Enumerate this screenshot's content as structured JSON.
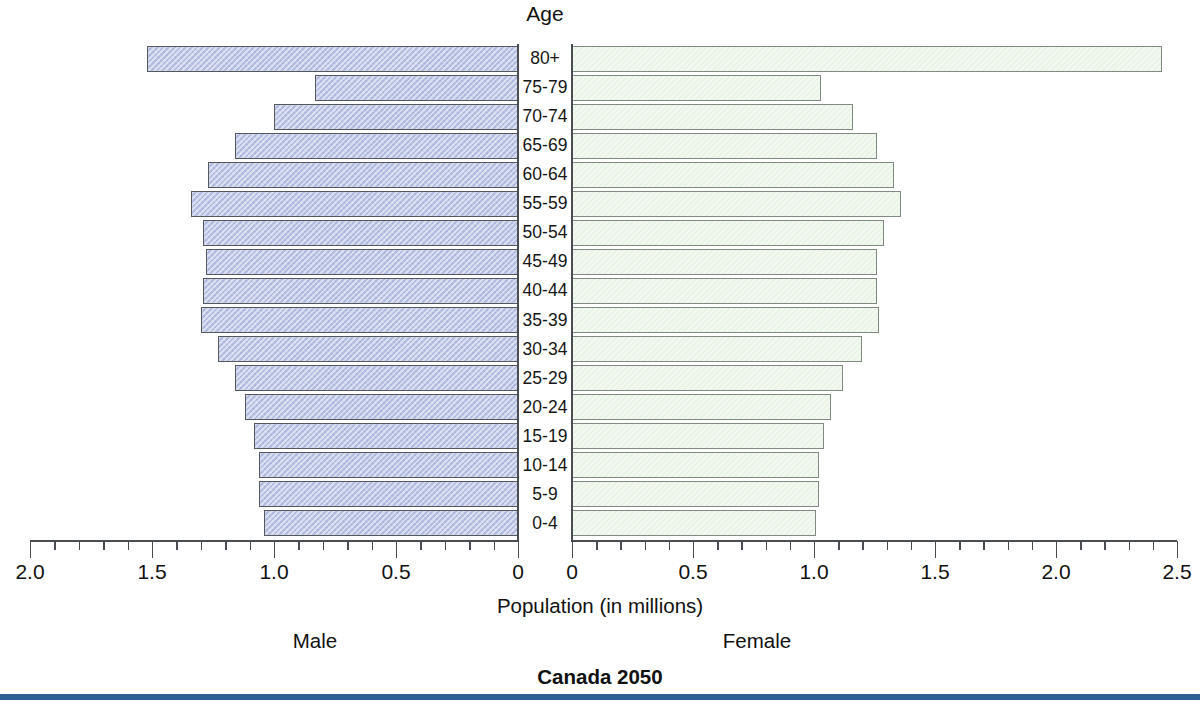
{
  "chart_data": {
    "type": "bar",
    "subtype": "population-pyramid",
    "title": "Canada 2050",
    "xlabel": "Population (in millions)",
    "ylabel": "Age",
    "categories": [
      "80+",
      "75-79",
      "70-74",
      "65-69",
      "60-64",
      "55-59",
      "50-54",
      "45-49",
      "40-44",
      "35-39",
      "30-34",
      "25-29",
      "20-24",
      "15-19",
      "10-14",
      "5-9",
      "0-4"
    ],
    "series": [
      {
        "name": "Male",
        "side": "left",
        "axis_label": "Male",
        "xlim": [
          2.0,
          0
        ],
        "tick_labels": [
          "2.0",
          "1.5",
          "1.0",
          "0.5",
          "0"
        ],
        "tick_values": [
          2.0,
          1.5,
          1.0,
          0.5,
          0
        ],
        "minor_tick_step": 0.1,
        "color": "#b9c2e4",
        "border_color": "#55595e",
        "values": [
          1.52,
          0.83,
          1.0,
          1.16,
          1.27,
          1.34,
          1.29,
          1.28,
          1.29,
          1.3,
          1.23,
          1.16,
          1.12,
          1.08,
          1.06,
          1.06,
          1.04
        ]
      },
      {
        "name": "Female",
        "side": "right",
        "axis_label": "Female",
        "xlim": [
          0,
          2.5
        ],
        "tick_labels": [
          "0",
          "0.5",
          "1.0",
          "1.5",
          "2.0",
          "2.5"
        ],
        "tick_values": [
          0,
          0.5,
          1.0,
          1.5,
          2.0,
          2.5
        ],
        "minor_tick_step": 0.1,
        "color": "#e9f3e6",
        "border_color": "#7f8a80",
        "values": [
          2.44,
          1.03,
          1.16,
          1.26,
          1.33,
          1.36,
          1.29,
          1.26,
          1.26,
          1.27,
          1.2,
          1.12,
          1.07,
          1.04,
          1.02,
          1.02,
          1.01
        ]
      }
    ],
    "grid": false,
    "legend": "below-axis"
  },
  "labels": {
    "age_header": "Age",
    "population_axis": "Population (in millions)",
    "male_caption": "Male",
    "female_caption": "Female",
    "chart_title": "Canada 2050"
  },
  "colors": {
    "male_fill": "#b9c2e4",
    "female_fill": "#e9f3e6",
    "bar_border": "#55595e",
    "axis": "#4a4e53",
    "rule": "#2d5f94",
    "text": "#111111"
  }
}
